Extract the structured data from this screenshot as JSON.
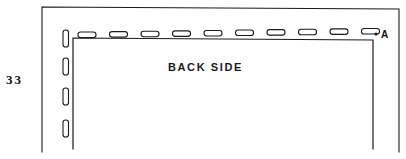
{
  "figure": {
    "page_number": "33",
    "back_side_label": "BACK SIDE",
    "point_label": "A",
    "ink_color": "#1a1a1a",
    "background_color": "#ffffff",
    "frame": {
      "name": "outer-page-frame",
      "left_x": 42,
      "right_x": 399,
      "top_y_left": 7,
      "top_y_right": 9,
      "bottom_y": 152
    },
    "panel": {
      "name": "back-panel-outline",
      "left_x": 73,
      "right_x": 373,
      "top_y_left": 38,
      "top_y_right": 40,
      "bottom_y": 149
    },
    "point_marker": {
      "name": "point-a-dot",
      "x": 376,
      "y": 34,
      "radius": 1.6
    },
    "top_slots": {
      "name": "top-edge-slots",
      "count": 10,
      "width": 18,
      "height": 5.5,
      "rx": 2.6,
      "start_x": 78,
      "spacing": 31.5,
      "start_y": 32,
      "y_rise_total": -3.5
    },
    "left_slots": {
      "name": "left-edge-slots",
      "count": 4,
      "width": 5.5,
      "height": 17,
      "rx": 2.6,
      "x": 63,
      "positions_y": [
        30,
        58,
        88,
        120
      ]
    }
  }
}
